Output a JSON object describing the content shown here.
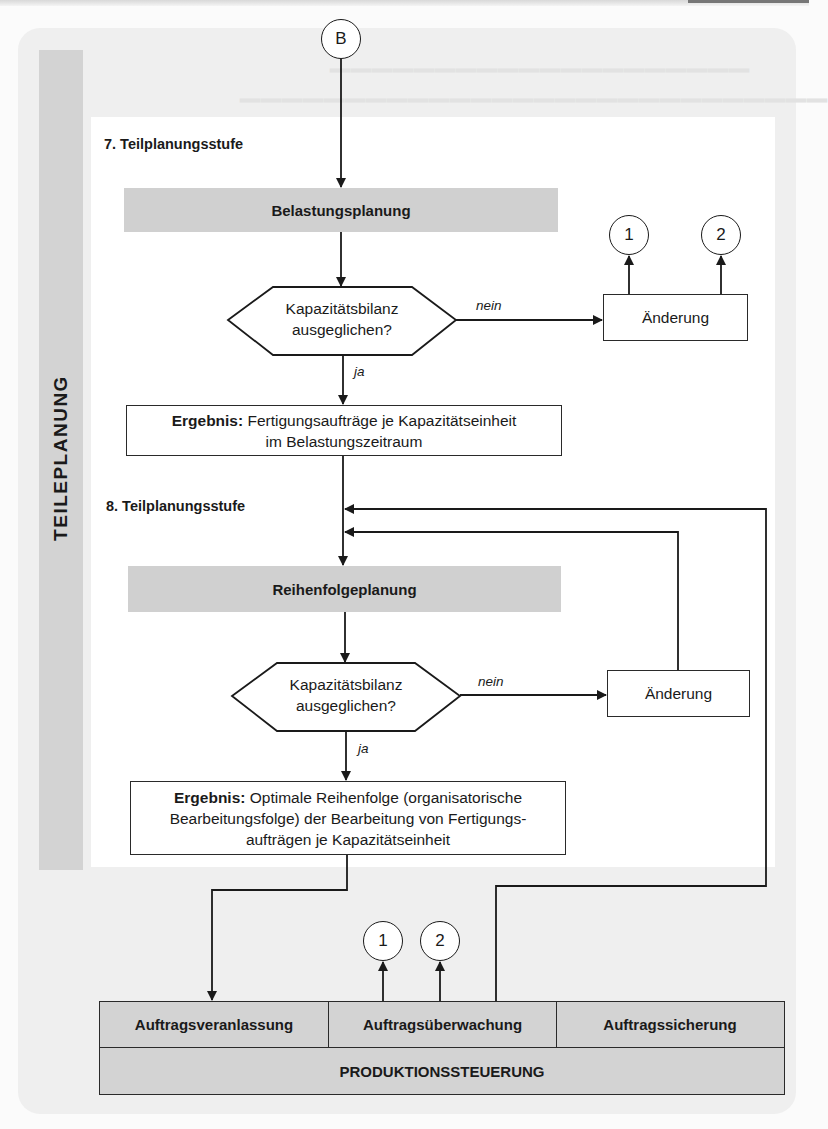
{
  "sidebar": {
    "label": "TEILEPLANUNG"
  },
  "start_connector": {
    "label": "B"
  },
  "stage7": {
    "title": "7. Teilplanungsstufe",
    "process": "Belastungsplanung",
    "decision": {
      "line1": "Kapazitätsbilanz",
      "line2": "ausgeglichen?"
    },
    "no_label": "nein",
    "yes_label": "ja",
    "change_box": "Änderung",
    "connectors": [
      "1",
      "2"
    ],
    "result": {
      "bold": "Ergebnis:",
      "line1": "Fertigungsaufträge je Kapazitätseinheit",
      "line2": "im Belastungszeitraum"
    }
  },
  "stage8": {
    "title": "8. Teilplanungsstufe",
    "process": "Reihenfolgeplanung",
    "decision": {
      "line1": "Kapazitätsbilanz",
      "line2": "ausgeglichen?"
    },
    "no_label": "nein",
    "yes_label": "ja",
    "change_box": "Änderung",
    "result": {
      "bold": "Ergebnis:",
      "line1": "Optimale Reihenfolge (organisatorische",
      "line2": "Bearbeitungsfolge) der Bearbeitung von Fertigungs-",
      "line3": "aufträgen je Kapazitätseinheit"
    }
  },
  "bottom_connectors": [
    "1",
    "2"
  ],
  "production_control": {
    "cells": [
      "Auftragsveranlassung",
      "Auftragsüberwachung",
      "Auftragssicherung"
    ],
    "footer": "PRODUKTIONSSTEUERUNG"
  },
  "colors": {
    "process_fill": "#d0d0d0",
    "sidebar_fill": "#d3d3d3",
    "outer_panel": "#efefef",
    "line": "#1a1a1a"
  }
}
